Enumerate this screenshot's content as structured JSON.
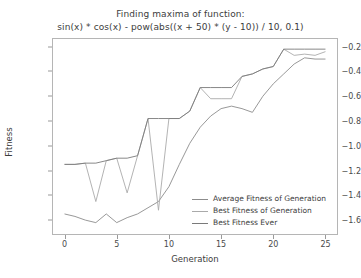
{
  "chart_data": {
    "type": "line",
    "title": "Finding maxima of function:",
    "subtitle": "sin(x) * cos(x) - pow(abs((x + 50) * (y - 10)) / 10, 0.1)",
    "xlabel": "Generation",
    "ylabel": "Fitness",
    "xlim": [
      -1.2,
      26.2
    ],
    "ylim": [
      -1.72,
      -0.13
    ],
    "xticks": [
      0,
      5,
      10,
      15,
      20,
      25
    ],
    "xtick_labels": [
      "0",
      "5",
      "10",
      "15",
      "20",
      "25"
    ],
    "yticks": [
      -0.2,
      -0.4,
      -0.6,
      -0.8,
      -1.0,
      -1.2,
      -1.4,
      -1.6
    ],
    "ytick_labels": [
      "−0.2",
      "−0.4",
      "−0.6",
      "−0.8",
      "−1.0",
      "−1.2",
      "−1.4",
      "−1.6"
    ],
    "grid": false,
    "legend_position": "lower right",
    "x": [
      0,
      1,
      2,
      3,
      4,
      5,
      6,
      7,
      8,
      9,
      10,
      11,
      12,
      13,
      14,
      15,
      16,
      17,
      18,
      19,
      20,
      21,
      22,
      23,
      24,
      25
    ],
    "series": [
      {
        "name": "Average Fitness of Generation",
        "color": "#8c8c8c",
        "values": [
          -1.55,
          -1.57,
          -1.6,
          -1.62,
          -1.55,
          -1.62,
          -1.58,
          -1.55,
          -1.5,
          -1.45,
          -1.33,
          -1.15,
          -0.98,
          -0.85,
          -0.76,
          -0.7,
          -0.68,
          -0.7,
          -0.73,
          -0.6,
          -0.5,
          -0.42,
          -0.34,
          -0.29,
          -0.3,
          -0.3
        ]
      },
      {
        "name": "Best Fitness of Generation",
        "color": "#aaaaaa",
        "values": [
          -1.15,
          -1.15,
          -1.14,
          -1.45,
          -1.12,
          -1.1,
          -1.38,
          -1.08,
          -0.78,
          -1.52,
          -0.78,
          -0.78,
          -0.72,
          -0.53,
          -0.62,
          -0.62,
          -0.62,
          -0.44,
          -0.42,
          -0.38,
          -0.36,
          -0.22,
          -0.27,
          -0.26,
          -0.27,
          -0.24
        ]
      },
      {
        "name": "Best Fitness Ever",
        "color": "#7a7a7a",
        "values": [
          -1.15,
          -1.15,
          -1.14,
          -1.14,
          -1.12,
          -1.1,
          -1.1,
          -1.08,
          -0.78,
          -0.78,
          -0.78,
          -0.78,
          -0.72,
          -0.53,
          -0.53,
          -0.53,
          -0.53,
          -0.44,
          -0.42,
          -0.38,
          -0.36,
          -0.22,
          -0.22,
          -0.22,
          -0.22,
          -0.22
        ]
      }
    ]
  },
  "legend": {
    "items": [
      {
        "label": "Average Fitness of Generation"
      },
      {
        "label": "Best Fitness of Generation"
      },
      {
        "label": "Best Fitness Ever"
      }
    ]
  },
  "colors": {
    "axis": "#b5b5b5",
    "text": "#3c3c3c",
    "background": "#ffffff"
  }
}
